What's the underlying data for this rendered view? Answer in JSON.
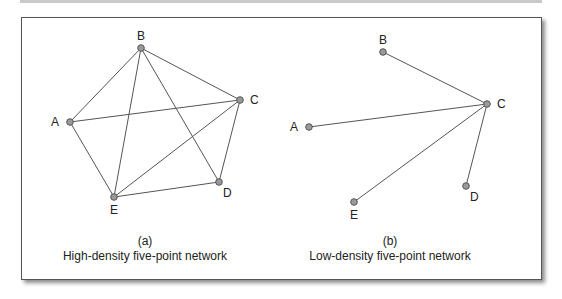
{
  "figures": [
    {
      "id": "a",
      "panel_label": "(a)",
      "caption": "High-density five-point network",
      "nodes": [
        {
          "name": "A",
          "x": 70,
          "y": 122,
          "label_pos": "left"
        },
        {
          "name": "B",
          "x": 141,
          "y": 48,
          "label_pos": "top"
        },
        {
          "name": "C",
          "x": 240,
          "y": 100,
          "label_pos": "right"
        },
        {
          "name": "D",
          "x": 219,
          "y": 182,
          "label_pos": "bottom-right"
        },
        {
          "name": "E",
          "x": 114,
          "y": 197,
          "label_pos": "bottom"
        }
      ],
      "edges": [
        [
          "A",
          "B"
        ],
        [
          "A",
          "C"
        ],
        [
          "A",
          "E"
        ],
        [
          "B",
          "C"
        ],
        [
          "B",
          "D"
        ],
        [
          "B",
          "E"
        ],
        [
          "C",
          "D"
        ],
        [
          "C",
          "E"
        ],
        [
          "D",
          "E"
        ]
      ]
    },
    {
      "id": "b",
      "panel_label": "(b)",
      "caption": "Low-density five-point network",
      "nodes": [
        {
          "name": "A",
          "x": 309,
          "y": 127,
          "label_pos": "left"
        },
        {
          "name": "B",
          "x": 383,
          "y": 52,
          "label_pos": "top"
        },
        {
          "name": "C",
          "x": 487,
          "y": 104,
          "label_pos": "right"
        },
        {
          "name": "D",
          "x": 466,
          "y": 186,
          "label_pos": "bottom-right"
        },
        {
          "name": "E",
          "x": 354,
          "y": 202,
          "label_pos": "bottom"
        }
      ],
      "edges": [
        [
          "B",
          "C"
        ],
        [
          "A",
          "C"
        ],
        [
          "E",
          "C"
        ],
        [
          "D",
          "C"
        ]
      ]
    }
  ],
  "colors": {
    "edge": "#555555",
    "node_fill": "#9a9a9a",
    "node_stroke": "#555555"
  }
}
